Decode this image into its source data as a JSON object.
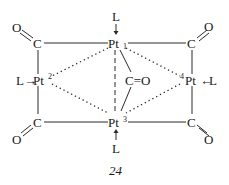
{
  "diagram": {
    "caption": "24",
    "atoms": {
      "pt1": {
        "symbol": "Pt",
        "index": "1"
      },
      "pt2": {
        "symbol": "Pt",
        "index": "2"
      },
      "pt3": {
        "symbol": "Pt",
        "index": "3"
      },
      "pt4": {
        "symbol": "Pt",
        "index": "4"
      },
      "ligand": "L",
      "carbon": "C",
      "oxygen": "O",
      "central_co": "C=O"
    },
    "arrows": {
      "right": "→",
      "left": "←"
    },
    "colors": {
      "ink": "#1a1a1a",
      "background": "#ffffff"
    }
  }
}
